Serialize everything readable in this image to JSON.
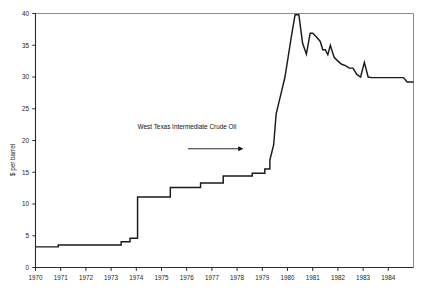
{
  "chart_data": {
    "type": "line",
    "title": "",
    "xlabel": "",
    "ylabel": "$ per barrel",
    "xlim": [
      1970,
      1985
    ],
    "ylim": [
      0,
      40
    ],
    "grid": false,
    "legend": "none",
    "y_ticks": [
      0,
      5,
      10,
      15,
      20,
      25,
      30,
      35,
      40
    ],
    "y_tick_labels": [
      "0",
      "5",
      "10",
      "15",
      "20",
      "25",
      "30",
      "35",
      "40"
    ],
    "x_ticks": [
      1970,
      1971,
      1972,
      1973,
      1974,
      1975,
      1976,
      1977,
      1978,
      1979,
      1980,
      1981,
      1982,
      1983,
      1984
    ],
    "x_tick_labels": [
      "1970",
      "1971",
      "1972",
      "1973",
      "1974",
      "1975",
      "1976",
      "1977",
      "1978",
      "1979",
      "1980",
      "1981",
      "1982",
      "1983",
      "1984"
    ],
    "annotations": [
      {
        "text": "West Texas Intermediate Crude Oil",
        "text_x": 1974.05,
        "text_y": 21.8,
        "arrow_from_x": 1976.05,
        "arrow_from_y": 18.7,
        "arrow_to_x": 1978.25,
        "arrow_to_y": 18.7
      }
    ],
    "series": [
      {
        "name": "West Texas Intermediate Crude Oil",
        "color": "#1a1a1a",
        "x": [
          1970.0,
          1970.9,
          1970.9,
          1973.4,
          1973.4,
          1973.75,
          1973.75,
          1973.95,
          1973.95,
          1974.05,
          1974.05,
          1975.0,
          1975.0,
          1975.35,
          1975.35,
          1976.1,
          1976.1,
          1976.55,
          1976.55,
          1977.1,
          1977.1,
          1977.45,
          1977.45,
          1978.1,
          1978.1,
          1978.6,
          1978.6,
          1979.1,
          1979.1,
          1979.3,
          1979.3,
          1979.45,
          1979.55,
          1979.75,
          1979.9,
          1980.0,
          1980.15,
          1980.3,
          1980.45,
          1980.6,
          1980.75,
          1980.9,
          1981.0,
          1981.15,
          1981.3,
          1981.4,
          1981.5,
          1981.6,
          1981.7,
          1981.85,
          1982.0,
          1982.15,
          1982.3,
          1982.45,
          1982.6,
          1982.75,
          1982.9,
          1983.05,
          1983.2,
          1983.35,
          1983.5,
          1984.6,
          1984.75,
          1985.0
        ],
        "y": [
          3.25,
          3.25,
          3.55,
          3.55,
          4.05,
          4.05,
          4.6,
          4.6,
          4.6,
          4.6,
          11.1,
          11.1,
          11.1,
          11.1,
          12.6,
          12.6,
          12.6,
          12.6,
          13.3,
          13.3,
          13.3,
          13.3,
          14.4,
          14.4,
          14.4,
          14.4,
          14.85,
          14.85,
          15.5,
          15.5,
          16.9,
          19.3,
          24.2,
          27.5,
          30.0,
          32.5,
          36.3,
          39.8,
          39.8,
          35.3,
          33.6,
          36.9,
          36.9,
          36.3,
          35.6,
          34.3,
          34.3,
          33.5,
          35.0,
          33.1,
          32.5,
          32.0,
          31.8,
          31.4,
          31.4,
          30.4,
          30.0,
          32.3,
          30.0,
          29.9,
          29.9,
          29.9,
          29.2,
          29.2
        ]
      }
    ]
  }
}
